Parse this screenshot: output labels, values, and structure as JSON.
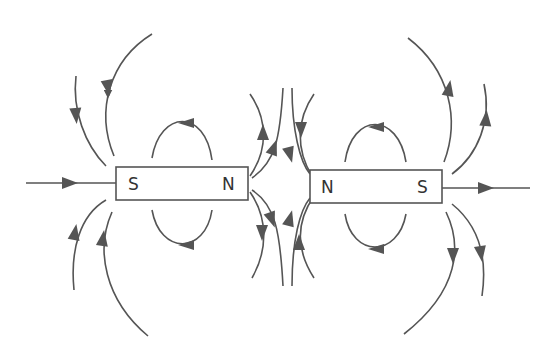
{
  "diagram": {
    "colors": {
      "line": "#555555",
      "text": "#333333",
      "background": "#ffffff"
    },
    "magnets": [
      {
        "id": "left",
        "left_pole": "S",
        "right_pole": "N"
      },
      {
        "id": "right",
        "left_pole": "N",
        "right_pole": "S"
      }
    ]
  }
}
